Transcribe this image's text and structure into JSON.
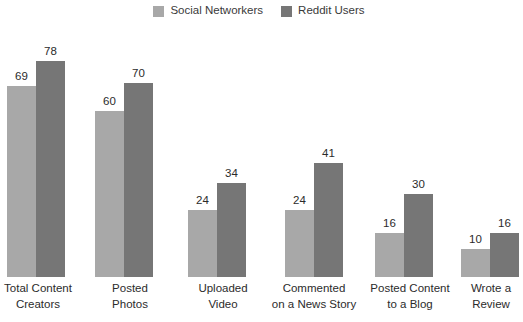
{
  "chart_data": {
    "type": "bar",
    "title": "",
    "subtitle": "",
    "xlabel": "",
    "ylabel": "",
    "ylim": [
      0,
      84
    ],
    "grid": false,
    "legend_position": "top-center",
    "categories": [
      "Total Content\nCreators",
      "Posted\nPhotos",
      "Uploaded\nVideo",
      "Commented\non a News Story",
      "Posted Content\nto a Blog",
      "Wrote a\nReview"
    ],
    "series": [
      {
        "name": "Social Networkers",
        "color": "#a8a8a8",
        "values": [
          69,
          60,
          24,
          24,
          16,
          10
        ]
      },
      {
        "name": "Reddit Users",
        "color": "#767676",
        "values": [
          78,
          70,
          34,
          41,
          30,
          16
        ]
      }
    ]
  },
  "legend": {
    "entries": [
      {
        "label": "Social Networkers",
        "color": "#a8a8a8"
      },
      {
        "label": "Reddit Users",
        "color": "#767676"
      }
    ]
  },
  "colors": {
    "background": "#ffffff",
    "series_light": "#a8a8a8",
    "series_dark": "#767676",
    "label_text": "#2b2b2b",
    "legend_text": "#3a3a3a"
  }
}
